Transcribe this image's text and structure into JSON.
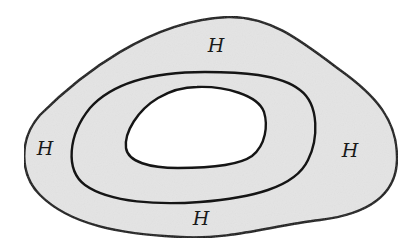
{
  "diagram": {
    "colors": {
      "fill": "#e4e4e4",
      "stroke": "#151515",
      "hole": "#ffffff"
    },
    "labels": [
      {
        "id": "top",
        "text": "H"
      },
      {
        "id": "left",
        "text": "H"
      },
      {
        "id": "right",
        "text": "H"
      },
      {
        "id": "bottom",
        "text": "H"
      }
    ]
  }
}
